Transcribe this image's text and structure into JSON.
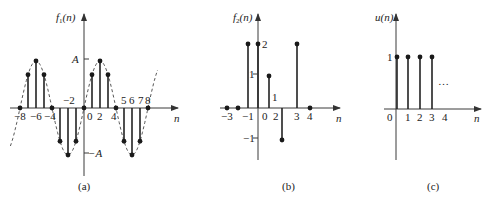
{
  "figure": {
    "panels": [
      {
        "id": "a",
        "caption": "(a)",
        "ylabel": "f1(n)",
        "ylabel_main": "f",
        "ylabel_sub": "1",
        "ylabel_arg": "(n)",
        "xlabel": "n",
        "ytick_labels": [
          "A",
          "−A"
        ],
        "xtick_labels": [
          "−8",
          "−6",
          "−4",
          "−2",
          "0",
          "2",
          "4",
          "5",
          "6",
          "7",
          "8"
        ],
        "envelope": "dashed sinusoid"
      },
      {
        "id": "b",
        "caption": "(b)",
        "ylabel": "f2(n)",
        "ylabel_main": "f",
        "ylabel_sub": "2",
        "ylabel_arg": "(n)",
        "xlabel": "n",
        "ytick_labels": [
          "2",
          "1",
          "−1"
        ],
        "xtick_labels": [
          "−3",
          "−1",
          "0",
          "2",
          "3",
          "4"
        ],
        "annotation": "1"
      },
      {
        "id": "c",
        "caption": "(c)",
        "ylabel": "u(n)",
        "xlabel": "n",
        "ytick_labels": [
          "1"
        ],
        "xtick_labels": [
          "0",
          "1",
          "2",
          "3",
          "4"
        ],
        "continuation": "…"
      }
    ]
  },
  "chart_data": [
    {
      "type": "stem",
      "title": "(a)",
      "ylabel": "f1(n)",
      "xlabel": "n",
      "x": [
        -8,
        -7,
        -6,
        -5,
        -4,
        -3,
        -2,
        -1,
        0,
        1,
        2,
        3,
        4,
        5,
        6,
        7,
        8
      ],
      "values": [
        0,
        0.707,
        1,
        0.707,
        0,
        -0.707,
        -1,
        -0.707,
        0,
        0.707,
        1,
        0.707,
        0,
        -0.707,
        -1,
        -0.707,
        0
      ],
      "value_unit": "A",
      "ylim": [
        -1,
        1
      ],
      "envelope": "A·sin(πn/4), dashed"
    },
    {
      "type": "stem",
      "title": "(b)",
      "ylabel": "f2(n)",
      "xlabel": "n",
      "x": [
        -3,
        -2,
        -1,
        0,
        1,
        2,
        3,
        4
      ],
      "values": [
        0,
        0,
        2,
        2,
        1,
        -1,
        2,
        0
      ],
      "ylim": [
        -1,
        2
      ]
    },
    {
      "type": "stem",
      "title": "(c)",
      "ylabel": "u(n)",
      "xlabel": "n",
      "x": [
        0,
        1,
        2,
        3
      ],
      "values": [
        1,
        1,
        1,
        1
      ],
      "continues": "…",
      "ylim": [
        0,
        1
      ]
    }
  ]
}
